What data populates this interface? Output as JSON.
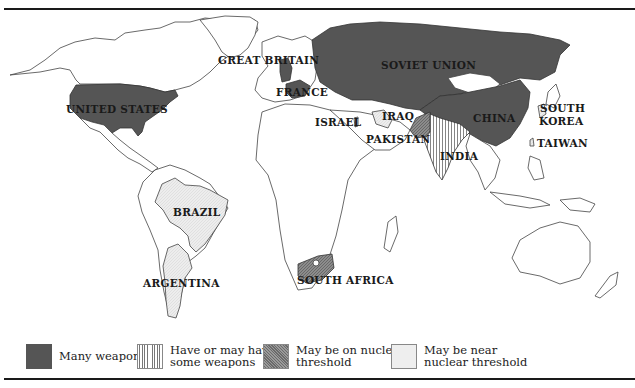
{
  "map": {
    "title": "Nuclear weapons status world map",
    "colors": {
      "many_weapons": "#555555",
      "have_or_may_have": "#777777",
      "nuclear_threshold": "#8a8a8a",
      "near_threshold": "#eeeeee",
      "outline": "#444444"
    },
    "country_labels": {
      "united_states": "UNITED STATES",
      "great_britain": "GREAT BRITAIN",
      "france": "FRANCE",
      "soviet_union": "SOVIET UNION",
      "china": "CHINA",
      "israel": "ISRAEL",
      "iraq": "IRAQ",
      "pakistan": "PAKISTAN",
      "india": "INDIA",
      "south_korea_line1": "SOUTH",
      "south_korea_line2": "KOREA",
      "taiwan": "TAIWAN",
      "brazil": "BRAZIL",
      "argentina": "ARGENTINA",
      "south_africa": "SOUTH AFRICA"
    },
    "categories": {
      "many_weapons": [
        "UNITED STATES",
        "GREAT BRITAIN",
        "FRANCE",
        "SOVIET UNION",
        "CHINA"
      ],
      "have_or_may_have_some_weapons": [
        "ISRAEL",
        "INDIA"
      ],
      "may_be_on_nuclear_threshold": [
        "PAKISTAN",
        "SOUTH AFRICA"
      ],
      "may_be_near_nuclear_threshold": [
        "IRAQ",
        "BRAZIL",
        "ARGENTINA",
        "SOUTH KOREA",
        "TAIWAN"
      ]
    }
  },
  "legend": {
    "items": [
      {
        "key": "many_weapons",
        "line1": "Many weapons",
        "line2": ""
      },
      {
        "key": "have_or_may_have",
        "line1": "Have or may have",
        "line2": "some weapons"
      },
      {
        "key": "nuclear_threshold",
        "line1": "May be on nuclear",
        "line2": "threshold"
      },
      {
        "key": "near_threshold",
        "line1": "May be near",
        "line2": "nuclear threshold"
      }
    ]
  }
}
